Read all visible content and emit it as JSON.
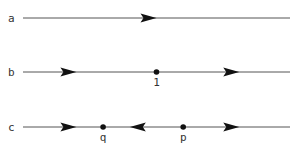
{
  "diagram": {
    "rows": [
      {
        "id": "a",
        "label": "a",
        "marks": [
          {
            "type": "arrow",
            "direction": "right",
            "pos": 0.47
          }
        ]
      },
      {
        "id": "b",
        "label": "b",
        "marks": [
          {
            "type": "arrow",
            "direction": "right",
            "pos": 0.17
          },
          {
            "type": "point",
            "label": "1",
            "pos": 0.5
          },
          {
            "type": "arrow",
            "direction": "right",
            "pos": 0.78
          }
        ]
      },
      {
        "id": "c",
        "label": "c",
        "marks": [
          {
            "type": "arrow",
            "direction": "right",
            "pos": 0.17
          },
          {
            "type": "point",
            "label": "q",
            "pos": 0.3
          },
          {
            "type": "arrow",
            "direction": "left",
            "pos": 0.43
          },
          {
            "type": "point",
            "label": "p",
            "pos": 0.6
          },
          {
            "type": "arrow",
            "direction": "right",
            "pos": 0.78
          }
        ]
      }
    ]
  }
}
